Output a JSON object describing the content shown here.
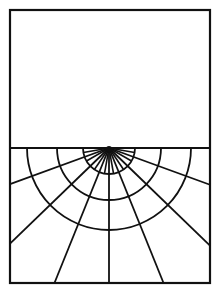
{
  "figure": {
    "stroke_color": "#111111",
    "background_color": "#ffffff",
    "frame": {
      "x": 10,
      "y": 10,
      "width": 200,
      "height": 273
    },
    "divider_y": 148,
    "center": {
      "x": 109,
      "y": 148
    },
    "arc_radii": [
      26,
      52,
      82
    ],
    "long_ray_angles_deg": [
      20,
      44,
      68,
      90,
      112,
      136,
      160
    ],
    "short_ray_angles_deg": [
      10,
      30,
      56,
      80,
      100,
      124,
      150,
      170
    ]
  }
}
